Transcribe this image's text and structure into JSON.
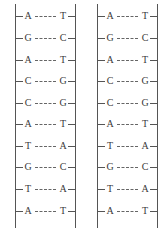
{
  "diagram": {
    "type": "dna-ladder",
    "strands": [
      {
        "id": "left",
        "pairs": [
          {
            "left": "A",
            "right": "T"
          },
          {
            "left": "G",
            "right": "C"
          },
          {
            "left": "A",
            "right": "T"
          },
          {
            "left": "C",
            "right": "G"
          },
          {
            "left": "C",
            "right": "G"
          },
          {
            "left": "A",
            "right": "T"
          },
          {
            "left": "T",
            "right": "A"
          },
          {
            "left": "G",
            "right": "C"
          },
          {
            "left": "T",
            "right": "A"
          },
          {
            "left": "A",
            "right": "T"
          }
        ]
      },
      {
        "id": "right",
        "pairs": [
          {
            "left": "A",
            "right": "T"
          },
          {
            "left": "G",
            "right": "C"
          },
          {
            "left": "A",
            "right": "T"
          },
          {
            "left": "C",
            "right": "G"
          },
          {
            "left": "C",
            "right": "G"
          },
          {
            "left": "A",
            "right": "T"
          },
          {
            "left": "T",
            "right": "A"
          },
          {
            "left": "G",
            "right": "C"
          },
          {
            "left": "T",
            "right": "A"
          },
          {
            "left": "A",
            "right": "T"
          }
        ]
      }
    ]
  }
}
